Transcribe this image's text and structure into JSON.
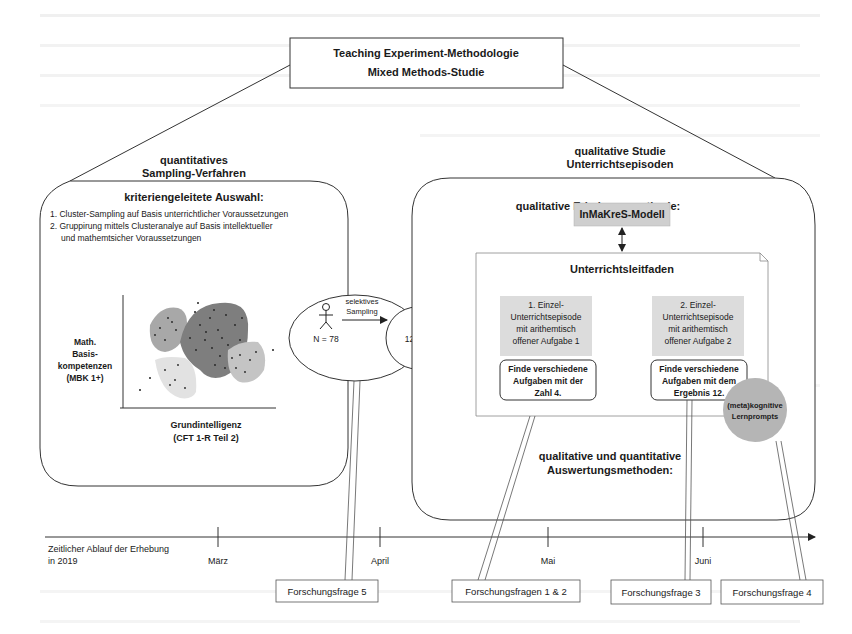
{
  "title": {
    "line1": "Teaching Experiment-Methodologie",
    "line2": "Mixed Methods-Studie"
  },
  "quantitative": {
    "heading_line1": "quantitatives",
    "heading_line2": "Sampling-Verfahren",
    "box_title": "kriteriengeleitete Auswahl:",
    "items": [
      "1. Cluster-Sampling auf Basis unterrichtlicher Voraussetzungen",
      "2. Gruppirung mittels Clusteranalye auf Basis intellektueller",
      "und mathemtsicher Voraussetzungen"
    ],
    "plot": {
      "ylabel_lines": [
        "Math.",
        "Basis-",
        "kompetenzen",
        "(MBK 1+)"
      ],
      "xlabel_lines": [
        "Grundintelligenz",
        "(CFT 1-R Teil 2)"
      ]
    }
  },
  "sampling": {
    "n_total": "N = 78",
    "arrow_label_line1": "selektives",
    "arrow_label_line2": "Sampling",
    "n_selected": "12≤N≤20"
  },
  "qualitative": {
    "heading_line1": "qualitative Studie",
    "heading_line2": "Unterrichtsepisoden",
    "method_title": "qualitative Erhebungsmethode:",
    "model": "InMaKreS-Modell",
    "guide_title": "Unterrichtsleitfaden",
    "episodes": [
      {
        "lines": [
          "1. Einzel-",
          "Unterrichtsepisode",
          "mit arithemtisch",
          "offener Aufgabe 1"
        ],
        "task_lines": [
          "Finde verschiedene",
          "Aufgaben mit der",
          "Zahl 4."
        ]
      },
      {
        "lines": [
          "2. Einzel-",
          "Unterrichtsepisode",
          "mit arithemtisch",
          "offener Aufgabe 2"
        ],
        "task_lines": [
          "Finde verschiedene",
          "Aufgaben mit dem",
          "Ergebnis 12."
        ]
      }
    ],
    "prompts_line1": "(meta)kognitive",
    "prompts_line2": "Lernprompts",
    "analysis_line1": "qualitative und quantitative",
    "analysis_line2": "Auswertungsmethoden:"
  },
  "timeline": {
    "label_line1": "Zeitlicher Ablauf der Erhebung",
    "label_line2": "in 2019",
    "months": [
      "März",
      "April",
      "Mai",
      "Juni"
    ]
  },
  "research_questions": [
    "Forschungsfrage 5",
    "Forschungsfragen 1 & 2",
    "Forschungsfrage 3",
    "Forschungsfrage 4"
  ]
}
